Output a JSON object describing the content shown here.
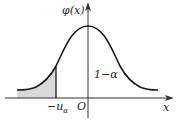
{
  "diagram": {
    "y_axis_label": "φ(x)",
    "x_axis_label": "x",
    "origin_label": "O",
    "critical_label_prefix": "−u",
    "critical_label_sub": "α",
    "region_label": "1−α",
    "colors": {
      "curve": "#1a1a1a",
      "axis": "#333333",
      "shade": "#d9d9d9"
    }
  }
}
